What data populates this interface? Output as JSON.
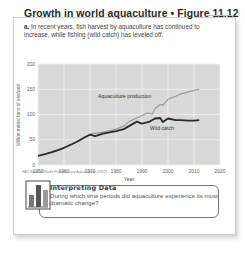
{
  "figure": {
    "title": "Growth in world aquaculture • Figure 11.12",
    "caption_label": "a.",
    "caption_text": "In recent years, fish harvest by aquaculture has continued to increase, while fishing (wild catch) has leveled off.",
    "source": "FAO State of World Fisheries and Aquaculture (2012)."
  },
  "interpreting_data": {
    "icon": "bar-chart-icon",
    "heading": "Interpreting Data",
    "question": "During which time periods did aquaculture experience its most dramatic change?"
  },
  "colors": {
    "plot_background": "#d9d9d9",
    "gridline": "#f2f2f2",
    "wild_catch_line": "#2b2b2b",
    "aquaculture_line": "#9a9a9a",
    "text": "#333333"
  },
  "chart_data": {
    "type": "line",
    "title": "Growth in world aquaculture",
    "xlabel": "Year",
    "ylabel": "Million metric tons of seafood",
    "xlim": [
      1950,
      2020
    ],
    "ylim": [
      0,
      200
    ],
    "x_ticks": [
      "1950",
      "1960",
      "1970",
      "1980",
      "1990",
      "2000",
      "2010",
      "2020"
    ],
    "y_ticks": [
      "0",
      "50",
      "100",
      "150",
      "200"
    ],
    "grid": true,
    "legend": "inline labels",
    "annotations": [
      "Aquaculture production",
      "Wild catch"
    ],
    "series": [
      {
        "name": "Wild catch",
        "x": [
          1950,
          1953,
          1955,
          1958,
          1960,
          1963,
          1965,
          1968,
          1970,
          1972,
          1975,
          1978,
          1980,
          1983,
          1985,
          1988,
          1990,
          1993,
          1995,
          1997,
          1998,
          2000,
          2003,
          2005,
          2008,
          2010,
          2012
        ],
        "values": [
          18,
          22,
          25,
          30,
          34,
          41,
          46,
          55,
          60,
          57,
          62,
          65,
          67,
          71,
          77,
          86,
          82,
          86,
          92,
          93,
          85,
          92,
          89,
          89,
          88,
          88,
          89
        ]
      },
      {
        "name": "Aquaculture production",
        "x": [
          1955,
          1958,
          1960,
          1965,
          1970,
          1975,
          1980,
          1983,
          1985,
          1988,
          1990,
          1992,
          1994,
          1995,
          1997,
          1998,
          2000,
          2003,
          2005,
          2008,
          2010,
          2012
        ],
        "values": [
          24,
          30,
          34,
          46,
          61,
          65,
          71,
          77,
          86,
          93,
          98,
          103,
          101,
          112,
          120,
          118,
          130,
          136,
          141,
          145,
          148,
          150
        ]
      }
    ]
  }
}
